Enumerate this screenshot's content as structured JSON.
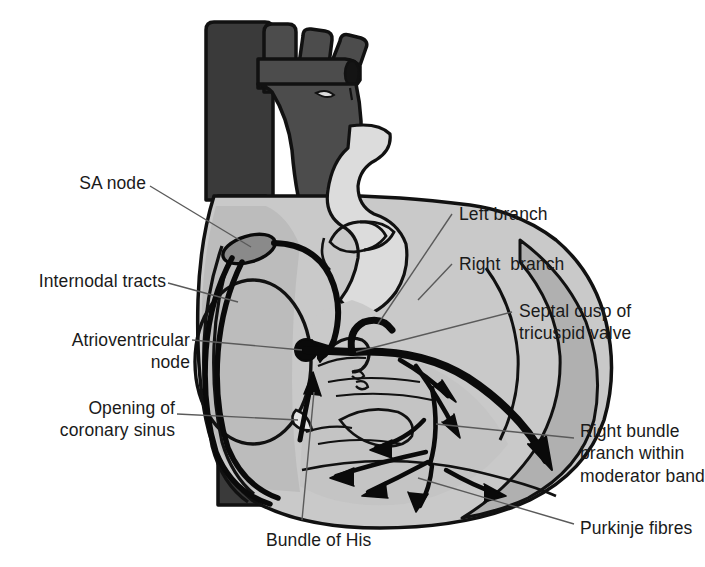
{
  "figure": {
    "type": "anatomical-diagram"
  },
  "palette": {
    "ink": "#111111",
    "outline": "#111111",
    "vein_dark": "#3a3a3a",
    "artery_mid": "#4c4c4c",
    "chamber_mid": "#a8a8a8",
    "myocardium": "#b9b9b9",
    "chamber_light": "#c9c9c9",
    "lumen_pale": "#dcdcdc",
    "sa_node_fill": "#8a8a8a",
    "background": "#ffffff",
    "leader_line": "#5a5a5a"
  },
  "labels": [
    {
      "id": "sa-node",
      "text": "SA node",
      "x": 82,
      "y": 172,
      "align": "right",
      "width": 120
    },
    {
      "id": "internodal-tracts",
      "text": "Internodal tracts",
      "x": 14,
      "y": 270,
      "align": "right",
      "width": 188
    },
    {
      "id": "atrioventricular-node",
      "text": "Atrioventricular\nnode",
      "x": 22,
      "y": 330,
      "align": "right",
      "width": 180
    },
    {
      "id": "opening-coronary-sinus",
      "text": "Opening of\ncoronary sinus",
      "x": 28,
      "y": 398,
      "align": "right",
      "width": 174
    },
    {
      "id": "left-branch",
      "text": "Left branch",
      "x": 457,
      "y": 203,
      "align": "left",
      "width": 180
    },
    {
      "id": "right-branch",
      "text": "Right  branch",
      "x": 457,
      "y": 254,
      "align": "left",
      "width": 190
    },
    {
      "id": "septal-cusp",
      "text": "Septal cusp of\ntricuspid valve",
      "x": 518,
      "y": 300,
      "align": "left",
      "width": 175
    },
    {
      "id": "right-bundle-branch",
      "text": "Right bundle\nbranch within\nmoderator band",
      "x": 578,
      "y": 420,
      "align": "left",
      "width": 150
    },
    {
      "id": "purkinje-fibres",
      "text": "Purkinje fibres",
      "x": 578,
      "y": 518,
      "align": "left",
      "width": 150
    },
    {
      "id": "bundle-of-his",
      "text": "Bundle of His",
      "x": 265,
      "y": 530,
      "align": "left",
      "width": 180
    }
  ],
  "structures": [
    {
      "id": "superior-vena-cava",
      "name": "Superior vena cava"
    },
    {
      "id": "aorta",
      "name": "Aorta"
    },
    {
      "id": "brachiocephalic-trunk",
      "name": "Brachiocephalic trunk"
    },
    {
      "id": "left-common-carotid",
      "name": "Left common carotid artery"
    },
    {
      "id": "left-subclavian",
      "name": "Left subclavian artery"
    },
    {
      "id": "pulmonary-trunk",
      "name": "Pulmonary trunk"
    },
    {
      "id": "inferior-vena-cava",
      "name": "Inferior vena cava"
    },
    {
      "id": "right-atrium",
      "name": "Right atrium"
    },
    {
      "id": "right-ventricle",
      "name": "Right ventricle"
    },
    {
      "id": "fossa-ovalis",
      "name": "Fossa ovalis"
    },
    {
      "id": "sa-node-body",
      "name": "Sinoatrial node"
    },
    {
      "id": "av-node-body",
      "name": "Atrioventricular node"
    },
    {
      "id": "his-bundle",
      "name": "Bundle of His"
    },
    {
      "id": "purkinje-network",
      "name": "Purkinje fibre network"
    }
  ]
}
